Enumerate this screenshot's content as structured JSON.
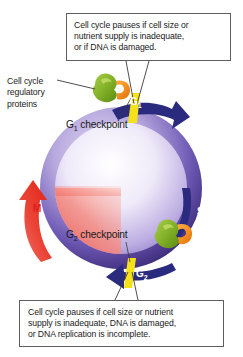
{
  "diagram": {
    "ring": {
      "purple_light": "#c9bde4",
      "purple_dark": "#3b2a7a",
      "arrow_blue": "#2a2a7e",
      "arrow_red": "#e8332a",
      "checkpoint_yellow": "#f5e11a",
      "protein_green": "#7fb02a",
      "protein_orange": "#f28b1e",
      "inner_red": "#f4766a"
    },
    "phases": [
      {
        "id": "g1",
        "label": "G",
        "sub": "1",
        "color": "#ffffff",
        "arrow": "blue"
      },
      {
        "id": "s",
        "label": "S",
        "sub": "",
        "color": "#ffffff",
        "arrow": "blue"
      },
      {
        "id": "g2",
        "label": "G",
        "sub": "2",
        "color": "#ffffff",
        "arrow": "blue"
      },
      {
        "id": "m",
        "label": "M",
        "sub": "",
        "color": "#e01f1f",
        "arrow": "red"
      }
    ],
    "checkpoints": [
      {
        "id": "g1-checkpoint",
        "prefix": "G",
        "sub": "1",
        "suffix": " checkpoint"
      },
      {
        "id": "g2-checkpoint",
        "prefix": "G",
        "sub": "2",
        "suffix": " checkpoint"
      }
    ],
    "side_label": {
      "name": "cell-cycle-regulatory-proteins",
      "lines": [
        "Cell cycle",
        "regulatory",
        "proteins"
      ]
    },
    "callouts": [
      {
        "id": "g1-callout",
        "lines": [
          "Cell cycle pauses if cell size or",
          "nutrient supply is inadequate,",
          "or if DNA is damaged."
        ]
      },
      {
        "id": "g2-callout",
        "lines": [
          "Cell cycle pauses if cell size or nutrient",
          "supply is inadequate, DNA is damaged,",
          "or DNA replication is incomplete."
        ]
      }
    ]
  }
}
